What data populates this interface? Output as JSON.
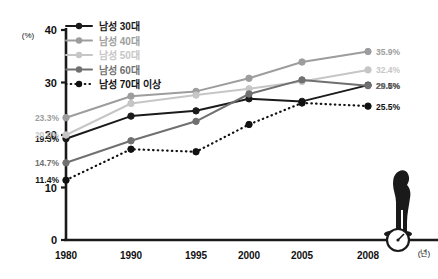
{
  "chart_data": {
    "type": "line",
    "title": "",
    "xlabel": "(년)",
    "ylabel": "(%)",
    "x": [
      "1980",
      "1990",
      "1995",
      "2000",
      "2005",
      "2008"
    ],
    "ylim": [
      0,
      40
    ],
    "yticks": [
      "0",
      "10",
      "20",
      "30",
      "40"
    ],
    "grid": false,
    "legend_position": "top-left",
    "series": [
      {
        "name": "남성 30대",
        "color": "#1a1a1a",
        "style": "solid",
        "values": [
          19.3,
          23.6,
          24.6,
          26.9,
          26.4,
          29.5
        ],
        "start_label": "19.3%",
        "end_label": "29.5%"
      },
      {
        "name": "남성 40대",
        "color": "#9d9d9d",
        "style": "solid",
        "values": [
          23.3,
          27.4,
          28.3,
          30.8,
          33.9,
          35.9
        ],
        "start_label": "23.3%",
        "end_label": "35.9%"
      },
      {
        "name": "남성 50대",
        "color": "#c6c6c6",
        "style": "solid",
        "values": [
          20.0,
          26.0,
          27.6,
          28.8,
          30.2,
          32.4
        ],
        "start_label": "20.0%",
        "end_label": "32.4%"
      },
      {
        "name": "남성 60대",
        "color": "#707070",
        "style": "solid",
        "values": [
          14.7,
          18.9,
          22.6,
          27.8,
          30.5,
          29.4
        ],
        "start_label": "14.7%",
        "end_label": "29.4%"
      },
      {
        "name": "남성 70대 이상",
        "color": "#111111",
        "style": "dotted",
        "values": [
          11.4,
          17.3,
          16.8,
          22.0,
          26.1,
          25.5
        ],
        "start_label": "11.4%",
        "end_label": "25.5%"
      }
    ],
    "annotation_icon": "person-on-scale-icon"
  }
}
